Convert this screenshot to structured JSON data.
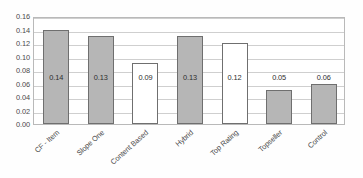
{
  "chart_data": {
    "type": "bar",
    "title": "",
    "subtitle": "",
    "xlabel": "",
    "ylabel": "",
    "categories": [
      "CF - Item",
      "Slope One",
      "Content Based",
      "Hybrid",
      "Top Rating",
      "Topseller",
      "Control"
    ],
    "values": [
      0.14,
      0.13,
      0.09,
      0.13,
      0.12,
      0.05,
      0.06
    ],
    "data_labels": [
      "0.14",
      "0.13",
      "0.09",
      "0.13",
      "0.12",
      "0.05",
      "0.06"
    ],
    "bar_styles": [
      "filled",
      "filled",
      "hollow",
      "filled",
      "hollow",
      "filled",
      "filled"
    ],
    "ylim": [
      0.0,
      0.16
    ],
    "ytick_values": [
      0.0,
      0.02,
      0.04,
      0.06,
      0.08,
      0.1,
      0.12,
      0.14,
      0.16
    ],
    "ytick_labels": [
      "0.00",
      "0.02",
      "0.04",
      "0.06",
      "0.08",
      "0.10",
      "0.12",
      "0.14",
      "0.16"
    ],
    "grid": true,
    "grid_axis": "y",
    "legend": false,
    "legend_position": "none",
    "xtick_rotation_degrees": -42,
    "colors": {
      "bar_fill": "#b6b6b6",
      "bar_hollow_fill": "#ffffff",
      "bar_border": "#6f6f6f",
      "gridline": "#cfcfcf",
      "plot_border": "#b9b9b9",
      "tick_text": "#4a4a4a",
      "value_text": "#2e2e2e",
      "background": "#ffffff"
    }
  }
}
